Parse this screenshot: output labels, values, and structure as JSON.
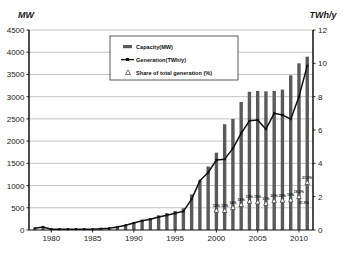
{
  "chart_data": {
    "type": "bar",
    "title": "",
    "subtitle": "",
    "xlabel": "",
    "ylabel": "MW",
    "ylabel_right": "TWh/y",
    "ylim": [
      0,
      4500
    ],
    "ylim_right": [
      0,
      12
    ],
    "xlim": [
      1977.3,
      2011.7
    ],
    "grid": true,
    "legend_position": "top-center",
    "y_ticks": [
      0,
      500,
      1000,
      1500,
      2000,
      2500,
      3000,
      3500,
      4000,
      4500
    ],
    "y_ticks_right": [
      0,
      2,
      4,
      6,
      8,
      10,
      12
    ],
    "x_ticks": [
      1980,
      1985,
      1990,
      1995,
      2000,
      2005,
      2010
    ],
    "x_tick_labels": [
      "1980",
      "1985",
      "1990",
      "1995",
      "2000",
      "2005",
      "2010"
    ],
    "x": [
      1978,
      1979,
      1980,
      1981,
      1982,
      1983,
      1984,
      1985,
      1986,
      1987,
      1988,
      1989,
      1990,
      1991,
      1992,
      1993,
      1994,
      1995,
      1996,
      1997,
      1998,
      1999,
      2000,
      2001,
      2002,
      2003,
      2004,
      2005,
      2006,
      2007,
      2008,
      2009,
      2010,
      2011
    ],
    "series": [
      {
        "name": "Capacity(MW)",
        "type": "bar",
        "axis": "left",
        "unit": "MW",
        "color": "#5a5a5a",
        "values": [
          30,
          70,
          15,
          15,
          15,
          15,
          15,
          15,
          20,
          30,
          65,
          110,
          170,
          230,
          270,
          330,
          380,
          430,
          490,
          800,
          1110,
          1430,
          1740,
          2380,
          2500,
          2880,
          3110,
          3130,
          3120,
          3130,
          3160,
          3480,
          3750,
          3900
        ]
      },
      {
        "name": "Generation(TWh/y)",
        "type": "line",
        "axis": "right",
        "unit": "TWh/y",
        "color": "#111111",
        "values": [
          0.1,
          0.18,
          0.05,
          0.05,
          0.05,
          0.05,
          0.05,
          0.05,
          0.07,
          0.1,
          0.18,
          0.28,
          0.42,
          0.55,
          0.65,
          0.78,
          0.88,
          1.0,
          1.12,
          1.85,
          2.95,
          3.45,
          4.2,
          4.25,
          4.9,
          5.8,
          6.55,
          6.6,
          6.05,
          7.0,
          6.9,
          6.65,
          8.0,
          9.85
        ]
      },
      {
        "name": "Share of total generation (%)",
        "type": "marker",
        "axis": "right",
        "marker": "triangle",
        "color": "#333333",
        "points": [
          {
            "x": 2000,
            "value": 1.18,
            "label": "12%"
          },
          {
            "x": 2001,
            "value": 1.16,
            "label": "12%"
          },
          {
            "x": 2002,
            "value": 1.35,
            "label": "14%"
          },
          {
            "x": 2003,
            "value": 1.52,
            "label": "16%"
          },
          {
            "x": 2004,
            "value": 1.72,
            "label": "19%"
          },
          {
            "x": 2005,
            "value": 1.68,
            "label": "19%"
          },
          {
            "x": 2006,
            "value": 1.6,
            "label": "17%"
          },
          {
            "x": 2007,
            "value": 1.75,
            "label": "20%"
          },
          {
            "x": 2008,
            "value": 1.78,
            "label": "20%"
          },
          {
            "x": 2009,
            "value": 1.8,
            "label": "19%"
          },
          {
            "x": 2010,
            "value": 2.0,
            "label": "18.2%"
          },
          {
            "x": 2011,
            "value": 2.85,
            "label": "21.9%"
          }
        ],
        "extra_labels": [
          {
            "x": 2010,
            "value": 1.55,
            "label": "21.9%"
          }
        ]
      }
    ],
    "legend": [
      {
        "key": "capacity",
        "label": "Capacity(MW)",
        "marker": "bar-swatch"
      },
      {
        "key": "generation",
        "label": "Generation(TWh/y)",
        "marker": "line-point"
      },
      {
        "key": "share",
        "label": "Share of total generation (%)",
        "marker": "triangle"
      }
    ]
  },
  "colors": {
    "bar": "#5a5a5a",
    "line": "#111111",
    "grid": "#9a9a9a",
    "axis": "#111111",
    "background": "#ffffff",
    "text": "#1a1a1a"
  }
}
